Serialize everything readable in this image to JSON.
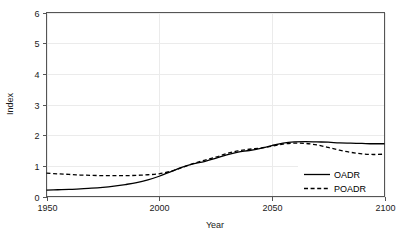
{
  "chart_data": {
    "type": "line",
    "title": "",
    "xlabel": "Year",
    "ylabel": "Index",
    "xlim": [
      1950,
      2100
    ],
    "ylim": [
      0,
      6
    ],
    "xticks": [
      1950,
      2000,
      2050,
      2100
    ],
    "yticks": [
      0,
      1,
      2,
      3,
      4,
      5,
      6
    ],
    "grid": true,
    "legend_position": "bottom-right",
    "x": [
      1950,
      1955,
      1960,
      1965,
      1970,
      1975,
      1980,
      1985,
      1990,
      1995,
      2000,
      2005,
      2010,
      2015,
      2020,
      2025,
      2030,
      2035,
      2040,
      2045,
      2050,
      2055,
      2060,
      2065,
      2070,
      2075,
      2080,
      2085,
      2090,
      2095,
      2100
    ],
    "series": [
      {
        "name": "OADR",
        "style": "solid",
        "color": "#000000",
        "values": [
          0.21,
          0.22,
          0.23,
          0.25,
          0.27,
          0.3,
          0.34,
          0.39,
          0.45,
          0.54,
          0.66,
          0.8,
          0.95,
          1.06,
          1.14,
          1.24,
          1.36,
          1.45,
          1.5,
          1.57,
          1.66,
          1.74,
          1.78,
          1.79,
          1.78,
          1.77,
          1.75,
          1.74,
          1.73,
          1.72,
          1.72
        ]
      },
      {
        "name": "POADR",
        "style": "dashed",
        "color": "#000000",
        "values": [
          0.76,
          0.74,
          0.72,
          0.7,
          0.69,
          0.68,
          0.68,
          0.68,
          0.69,
          0.71,
          0.74,
          0.82,
          0.94,
          1.07,
          1.18,
          1.28,
          1.4,
          1.49,
          1.54,
          1.58,
          1.64,
          1.71,
          1.74,
          1.73,
          1.68,
          1.6,
          1.51,
          1.44,
          1.39,
          1.37,
          1.38
        ]
      }
    ]
  },
  "legend": {
    "entries": [
      {
        "label": "OADR"
      },
      {
        "label": "POADR"
      }
    ]
  },
  "axes": {
    "y_title": "Index",
    "x_title": "Year",
    "y_tick_labels": [
      "0",
      "1",
      "2",
      "3",
      "4",
      "5",
      "6"
    ],
    "x_tick_labels": [
      "1950",
      "2000",
      "2050",
      "2100"
    ]
  }
}
